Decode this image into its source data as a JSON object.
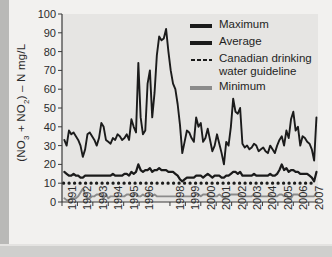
{
  "figure": {
    "name": "nitrate-nitrite-time-series-chart"
  },
  "axis": {
    "y_label_prefix": "(NO",
    "y_label_sub1": "3",
    "y_label_mid": " + NO",
    "y_label_sub2": "2",
    "y_label_suffix": ") – N mg/L",
    "y_label_full": "(NO3 + NO2) – N mg/L",
    "y_ticks": [
      "0",
      "10",
      "20",
      "30",
      "40",
      "50",
      "60",
      "70",
      "80",
      "90",
      "100"
    ],
    "x_ticks": [
      "1991",
      "1992",
      "1993",
      "1994",
      "1995",
      "1996",
      "1998",
      "1999",
      "2000",
      "2001",
      "2002",
      "2003",
      "2004",
      "2005",
      "2006",
      "2007"
    ]
  },
  "legend": {
    "items": [
      {
        "label": "Maximum",
        "style": "solid",
        "color": "#1b1b1b",
        "swatch": "legend-swatch-maximum"
      },
      {
        "label": "Average",
        "style": "solid",
        "color": "#1b1b1b",
        "swatch": "legend-swatch-average"
      },
      {
        "label": "Canadian drinking water guideline",
        "style": "dotted",
        "color": "#1b1b1b",
        "swatch": "legend-swatch-guideline"
      },
      {
        "label": "Minimum",
        "style": "solid",
        "color": "#8b8b8b",
        "swatch": "legend-swatch-minimum"
      }
    ]
  },
  "colors": {
    "maximum": "#1b1b1b",
    "average": "#1b1b1b",
    "guideline": "#1b1b1b",
    "minimum": "#8b8b8b",
    "plot_background": "#e6e5e3",
    "figure_background": "#f2f1ef",
    "axis": "#3a3a3a"
  },
  "chart_data": {
    "type": "line",
    "title": "",
    "xlabel": "",
    "ylabel": "(NO3 + NO2) – N mg/L",
    "xlim": [
      1991.0,
      2007.6
    ],
    "ylim": [
      0,
      100
    ],
    "grid": false,
    "legend_position": "top-right",
    "x_tick_values": [
      1991,
      1992,
      1993,
      1994,
      1995,
      1996,
      1998,
      1999,
      2000,
      2001,
      2002,
      2003,
      2004,
      2005,
      2006,
      2007
    ],
    "y_tick_values": [
      0,
      10,
      20,
      30,
      40,
      50,
      60,
      70,
      80,
      90,
      100
    ],
    "annotations": [
      {
        "text": "Peak maximum of about 92 mg/L occurs in 1997",
        "x": 1997.4,
        "y": 92
      },
      {
        "text": "Guideline constant at 10 mg/L",
        "x": 1999,
        "y": 10
      }
    ],
    "series": [
      {
        "name": "Canadian drinking water guideline",
        "style": "dotted",
        "color": "#1b1b1b",
        "constant_value": 10,
        "x": [
          1991.1,
          2007.5
        ],
        "values": [
          10,
          10
        ]
      },
      {
        "name": "Maximum",
        "style": "solid",
        "color": "#1b1b1b",
        "x": [
          1991.15,
          1991.3,
          1991.45,
          1991.6,
          1991.75,
          1991.9,
          1992.05,
          1992.2,
          1992.35,
          1992.5,
          1992.65,
          1992.8,
          1992.95,
          1993.1,
          1993.25,
          1993.4,
          1993.55,
          1993.7,
          1993.85,
          1994.0,
          1994.15,
          1994.3,
          1994.45,
          1994.6,
          1994.75,
          1994.9,
          1995.05,
          1995.2,
          1995.35,
          1995.5,
          1995.65,
          1995.8,
          1995.95,
          1996.1,
          1996.25,
          1996.4,
          1996.55,
          1996.7,
          1996.85,
          1997.0,
          1997.15,
          1997.3,
          1997.45,
          1997.6,
          1997.75,
          1997.9,
          1998.05,
          1998.2,
          1998.35,
          1998.5,
          1998.65,
          1998.8,
          1998.95,
          1999.1,
          1999.25,
          1999.4,
          1999.55,
          1999.7,
          1999.85,
          2000.0,
          2000.15,
          2000.3,
          2000.45,
          2000.6,
          2000.75,
          2000.9,
          2001.05,
          2001.2,
          2001.35,
          2001.5,
          2001.65,
          2001.8,
          2001.95,
          2002.1,
          2002.25,
          2002.4,
          2002.55,
          2002.7,
          2002.85,
          2003.0,
          2003.15,
          2003.3,
          2003.45,
          2003.6,
          2003.75,
          2003.9,
          2004.05,
          2004.2,
          2004.35,
          2004.5,
          2004.65,
          2004.8,
          2004.95,
          2005.1,
          2005.25,
          2005.4,
          2005.55,
          2005.7,
          2005.85,
          2006.0,
          2006.15,
          2006.3,
          2006.45,
          2006.6,
          2006.75,
          2006.9,
          2007.05,
          2007.2,
          2007.35,
          2007.5
        ],
        "values": [
          33,
          30,
          38,
          36,
          37,
          35,
          33,
          30,
          24,
          28,
          36,
          37,
          35,
          33,
          30,
          34,
          42,
          40,
          33,
          32,
          31,
          34,
          33,
          36,
          35,
          33,
          34,
          36,
          33,
          44,
          40,
          37,
          74,
          45,
          36,
          38,
          63,
          70,
          45,
          58,
          78,
          88,
          86,
          87,
          92,
          80,
          70,
          63,
          60,
          52,
          41,
          26,
          32,
          38,
          37,
          34,
          32,
          45,
          40,
          42,
          32,
          34,
          39,
          33,
          27,
          30,
          36,
          31,
          26,
          20,
          32,
          30,
          40,
          55,
          48,
          47,
          50,
          31,
          29,
          30,
          28,
          29,
          31,
          30,
          27,
          28,
          29,
          27,
          26,
          30,
          28,
          26,
          30,
          33,
          35,
          30,
          38,
          34,
          44,
          48,
          38,
          40,
          30,
          35,
          34,
          32,
          31,
          28,
          22,
          45
        ]
      },
      {
        "name": "Average",
        "style": "solid",
        "color": "#1b1b1b",
        "x": [
          1991.15,
          1991.3,
          1991.45,
          1991.6,
          1991.75,
          1991.9,
          1992.05,
          1992.2,
          1992.35,
          1992.5,
          1992.65,
          1992.8,
          1992.95,
          1993.1,
          1993.25,
          1993.4,
          1993.55,
          1993.7,
          1993.85,
          1994.0,
          1994.15,
          1994.3,
          1994.45,
          1994.6,
          1994.75,
          1994.9,
          1995.05,
          1995.2,
          1995.35,
          1995.5,
          1995.65,
          1995.8,
          1995.95,
          1996.1,
          1996.25,
          1996.4,
          1996.55,
          1996.7,
          1996.85,
          1997.0,
          1997.15,
          1997.3,
          1997.45,
          1997.6,
          1997.75,
          1997.9,
          1998.05,
          1998.2,
          1998.35,
          1998.5,
          1998.65,
          1998.8,
          1998.95,
          1999.1,
          1999.25,
          1999.4,
          1999.55,
          1999.7,
          1999.85,
          2000.0,
          2000.15,
          2000.3,
          2000.45,
          2000.6,
          2000.75,
          2000.9,
          2001.05,
          2001.2,
          2001.35,
          2001.5,
          2001.65,
          2001.8,
          2001.95,
          2002.1,
          2002.25,
          2002.4,
          2002.55,
          2002.7,
          2002.85,
          2003.0,
          2003.15,
          2003.3,
          2003.45,
          2003.6,
          2003.75,
          2003.9,
          2004.05,
          2004.2,
          2004.35,
          2004.5,
          2004.65,
          2004.8,
          2004.95,
          2005.1,
          2005.25,
          2005.4,
          2005.55,
          2005.7,
          2005.85,
          2006.0,
          2006.15,
          2006.3,
          2006.45,
          2006.6,
          2006.75,
          2006.9,
          2007.05,
          2007.2,
          2007.35,
          2007.5
        ],
        "values": [
          16,
          15,
          14,
          14,
          15,
          14,
          14,
          13,
          13,
          14,
          14,
          14,
          14,
          14,
          14,
          14,
          14,
          14,
          14,
          14,
          14,
          15,
          14,
          14,
          14,
          14,
          15,
          15,
          14,
          16,
          15,
          16,
          20,
          17,
          16,
          17,
          17,
          18,
          16,
          17,
          17,
          18,
          17,
          17,
          17,
          16,
          16,
          16,
          15,
          14,
          12,
          11,
          12,
          13,
          13,
          13,
          13,
          14,
          14,
          14,
          13,
          14,
          15,
          14,
          13,
          14,
          14,
          14,
          13,
          13,
          14,
          14,
          15,
          16,
          16,
          15,
          16,
          14,
          14,
          14,
          14,
          14,
          15,
          14,
          14,
          14,
          14,
          14,
          14,
          15,
          14,
          14,
          15,
          17,
          20,
          17,
          18,
          16,
          17,
          17,
          16,
          16,
          15,
          15,
          15,
          15,
          14,
          13,
          11,
          16
        ]
      },
      {
        "name": "Minimum",
        "style": "solid",
        "color": "#8b8b8b",
        "x": [
          1991.15,
          1991.3,
          1991.45,
          1991.6,
          1991.75,
          1991.9,
          1992.05,
          1992.2,
          1992.35,
          1992.5,
          1992.65,
          1992.8,
          1992.95,
          1993.1,
          1993.25,
          1993.4,
          1993.55,
          1993.7,
          1993.85,
          1994.0,
          1994.15,
          1994.3,
          1994.45,
          1994.6,
          1994.75,
          1994.9,
          1995.05,
          1995.2,
          1995.35,
          1995.5,
          1995.65,
          1995.8,
          1995.95,
          1996.1,
          1996.25,
          1996.4,
          1996.55,
          1996.7,
          1996.85,
          1997.0,
          1997.15,
          1997.3,
          1997.45,
          1997.6,
          1997.75,
          1997.9,
          1998.05,
          1998.2,
          1998.35,
          1998.5,
          1998.65,
          1998.8,
          1998.95,
          1999.1,
          1999.25,
          1999.4,
          1999.55,
          1999.7,
          1999.85,
          2000.0,
          2000.15,
          2000.3,
          2000.45,
          2000.6,
          2000.75,
          2000.9,
          2001.05,
          2001.2,
          2001.35,
          2001.5,
          2001.65,
          2001.8,
          2001.95,
          2002.1,
          2002.25,
          2002.4,
          2002.55,
          2002.7,
          2002.85,
          2003.0,
          2003.15,
          2003.3,
          2003.45,
          2003.6,
          2003.75,
          2003.9,
          2004.05,
          2004.2,
          2004.35,
          2004.5,
          2004.65,
          2004.8,
          2004.95,
          2005.1,
          2005.25,
          2005.4,
          2005.55,
          2005.7,
          2005.85,
          2006.0,
          2006.15,
          2006.3,
          2006.45,
          2006.6,
          2006.75,
          2006.9,
          2007.05,
          2007.2,
          2007.35,
          2007.5
        ],
        "values": [
          2,
          1,
          1,
          2,
          2,
          2,
          3,
          5,
          7,
          4,
          2,
          2,
          3,
          3,
          4,
          4,
          4,
          2,
          4,
          2,
          3,
          3,
          3,
          3,
          3,
          3,
          3,
          4,
          4,
          3,
          4,
          4,
          3,
          3,
          4,
          3,
          3,
          4,
          3,
          4,
          3,
          3,
          3,
          3,
          3,
          3,
          3,
          3,
          3,
          3,
          3,
          3,
          3,
          3,
          3,
          3,
          3,
          4,
          4,
          3,
          4,
          4,
          4,
          3,
          3,
          3,
          3,
          4,
          3,
          2,
          3,
          3,
          4,
          4,
          4,
          4,
          4,
          3,
          3,
          3,
          3,
          3,
          4,
          3,
          3,
          3,
          3,
          3,
          3,
          4,
          3,
          3,
          3,
          4,
          4,
          3,
          4,
          2,
          2,
          4,
          4,
          4,
          3,
          3,
          3,
          3,
          3,
          3,
          3,
          5
        ]
      }
    ]
  }
}
